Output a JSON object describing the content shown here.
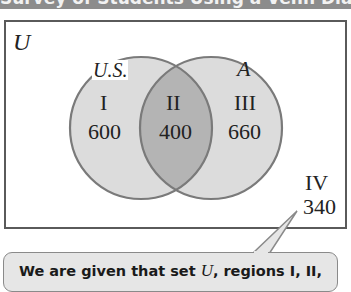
{
  "header": {
    "title_cropped": "Survey of Students Using a Venn Diagram"
  },
  "diagram": {
    "universe_label": "U",
    "sets": [
      {
        "name": "U.S.",
        "side": "left"
      },
      {
        "name": "A",
        "side": "right"
      }
    ],
    "regions": [
      {
        "numeral": "I",
        "value": "600"
      },
      {
        "numeral": "II",
        "value": "400"
      },
      {
        "numeral": "III",
        "value": "660"
      },
      {
        "numeral": "IV",
        "value": "340"
      }
    ],
    "colors": {
      "circle_fill": "#dcdcdc",
      "overlap_fill": "#b4b4b4",
      "circle_stroke": "#7a7a7a",
      "frame_stroke": "#5a5a5a",
      "callout_fill": "#e6e6e6"
    }
  },
  "callout": {
    "text_prefix": "We are given that set ",
    "text_var": "U",
    "text_suffix": ", regions I, II,"
  }
}
